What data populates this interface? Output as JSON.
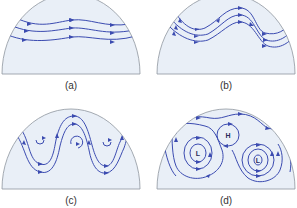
{
  "figure": {
    "panels": [
      {
        "id": "a",
        "label": "(a)",
        "description": "Straight, gently undulating westerly flow"
      },
      {
        "id": "b",
        "label": "(b)",
        "description": "Large-amplitude wavy flow"
      },
      {
        "id": "c",
        "label": "(c)",
        "description": "Deep meanders with closed eddies forming"
      },
      {
        "id": "d",
        "label": "(d)",
        "description": "Cut-off high and low pressure cells"
      }
    ],
    "pressure_labels": {
      "high": "H",
      "low": "L"
    },
    "colors": {
      "panel_fill": "#e9eff7",
      "panel_outline": "#8e959e",
      "streamline": "#3b4bb0",
      "label_text": "#333333"
    }
  }
}
